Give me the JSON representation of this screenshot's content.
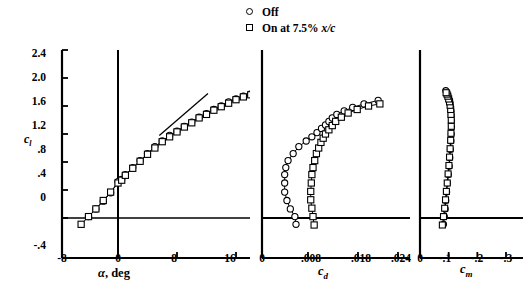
{
  "figure": {
    "width": 523,
    "height": 295,
    "background": "#ffffff",
    "line_color": "#000000"
  },
  "legend": {
    "position": "top-center",
    "items": [
      {
        "marker": "circle",
        "label": "Off"
      },
      {
        "marker": "square",
        "label": "On at 7.5% x/c"
      }
    ]
  },
  "chart_data": [
    {
      "type": "scatter",
      "panel": "lift-curve",
      "title": "",
      "xlabel": "α, deg",
      "ylabel": "c_l",
      "xlim": [
        -8,
        24
      ],
      "ylim": [
        -0.4,
        2.4
      ],
      "xticks": [
        -8,
        0,
        8,
        16,
        24
      ],
      "xticklabels": [
        "-8",
        "0",
        "8",
        "16",
        "24"
      ],
      "yticks": [
        -0.4,
        0,
        0.4,
        0.8,
        1.2,
        1.6,
        2.0,
        2.4
      ],
      "yticklabels": [
        "-.4",
        "0",
        ".4",
        ".8",
        "1.2",
        "1.6",
        "2.0",
        "2.4"
      ],
      "grid": false,
      "zero_lines": [
        "x=0",
        "y=0"
      ],
      "reference_line": {
        "x": [
          5.6,
          12.2
        ],
        "y": [
          1.18,
          1.78
        ]
      },
      "series": [
        {
          "name": "Off",
          "marker": "circle",
          "x": [
            -4.0,
            -3.0,
            -2.0,
            -1.0,
            0.0,
            0.5,
            1.0,
            2.0,
            3.0,
            4.0,
            5.0,
            6.0,
            7.0,
            8.0,
            9.0,
            10.0,
            11.0,
            12.0,
            13.0,
            14.0,
            15.0,
            16.0,
            17.0,
            18.0,
            19.0,
            20.0
          ],
          "y": [
            0.02,
            0.13,
            0.24,
            0.36,
            0.52,
            0.55,
            0.62,
            0.72,
            0.82,
            0.92,
            1.02,
            1.1,
            1.18,
            1.24,
            1.31,
            1.37,
            1.44,
            1.49,
            1.55,
            1.6,
            1.66,
            1.7,
            1.74,
            1.77,
            1.79,
            1.82
          ]
        },
        {
          "name": "On at 7.5% x/c",
          "marker": "square",
          "x": [
            -5.0,
            -4.0,
            -3.0,
            -2.0,
            -1.0,
            0.0,
            0.5,
            1.0,
            2.0,
            3.0,
            4.0,
            5.0,
            6.0,
            7.0,
            8.0,
            9.0,
            10.0,
            11.0,
            12.0,
            13.0,
            14.0,
            15.0,
            16.0,
            17.0,
            18.0,
            19.0,
            20.0
          ],
          "y": [
            -0.09,
            0.02,
            0.13,
            0.25,
            0.37,
            0.5,
            0.54,
            0.61,
            0.71,
            0.81,
            0.91,
            1.0,
            1.09,
            1.16,
            1.23,
            1.3,
            1.36,
            1.43,
            1.48,
            1.54,
            1.59,
            1.64,
            1.69,
            1.73,
            1.76,
            1.78,
            1.79
          ]
        }
      ]
    },
    {
      "type": "scatter",
      "panel": "drag-polar",
      "title": "",
      "xlabel": "c_d",
      "ylabel": "",
      "xlim": [
        0,
        0.024
      ],
      "ylim": [
        -0.4,
        2.4
      ],
      "xticks": [
        0,
        0.008,
        0.018,
        0.024
      ],
      "xticklabels": [
        "0",
        ".008",
        ".018",
        ".024"
      ],
      "grid": false,
      "zero_lines": [
        "y=0"
      ],
      "series": [
        {
          "name": "Off",
          "marker": "circle",
          "x": [
            0.006,
            0.0058,
            0.005,
            0.0044,
            0.004,
            0.004,
            0.004,
            0.0042,
            0.0046,
            0.0055,
            0.0065,
            0.0078,
            0.0088,
            0.0097,
            0.0105,
            0.0112,
            0.0118,
            0.0124,
            0.0132,
            0.0145,
            0.016,
            0.018,
            0.0205
          ],
          "y": [
            -0.09,
            0.02,
            0.13,
            0.25,
            0.37,
            0.5,
            0.62,
            0.72,
            0.82,
            0.92,
            1.02,
            1.1,
            1.16,
            1.22,
            1.28,
            1.33,
            1.38,
            1.43,
            1.48,
            1.53,
            1.58,
            1.63,
            1.68
          ]
        },
        {
          "name": "On at 7.5% x/c",
          "marker": "square",
          "x": [
            0.0092,
            0.009,
            0.0088,
            0.0086,
            0.0086,
            0.0087,
            0.0088,
            0.009,
            0.0093,
            0.0096,
            0.01,
            0.0104,
            0.0108,
            0.0112,
            0.0118,
            0.0124,
            0.013,
            0.014,
            0.0152,
            0.0168,
            0.0188,
            0.0208
          ],
          "y": [
            -0.1,
            0.02,
            0.14,
            0.26,
            0.38,
            0.5,
            0.62,
            0.72,
            0.82,
            0.92,
            1.0,
            1.08,
            1.14,
            1.2,
            1.26,
            1.32,
            1.38,
            1.44,
            1.5,
            1.55,
            1.6,
            1.63
          ]
        }
      ]
    },
    {
      "type": "scatter",
      "panel": "moment-curve",
      "title": "",
      "xlabel": "c_m",
      "ylabel": "",
      "xlim": [
        0,
        -0.3
      ],
      "ylim": [
        -0.4,
        2.4
      ],
      "xticks": [
        0,
        -0.1,
        -0.2,
        -0.3
      ],
      "xticklabels": [
        "0",
        "-.1",
        "-.2",
        "-.3"
      ],
      "grid": false,
      "zero_lines": [
        "y=0"
      ],
      "series": [
        {
          "name": "Off",
          "marker": "circle",
          "x": [
            -0.082,
            -0.085,
            -0.088,
            -0.09,
            -0.093,
            -0.096,
            -0.099,
            -0.102,
            -0.104,
            -0.106,
            -0.108,
            -0.109,
            -0.11,
            -0.11,
            -0.109,
            -0.108,
            -0.106,
            -0.104,
            -0.101,
            -0.098,
            -0.095,
            -0.092,
            -0.09
          ],
          "y": [
            -0.09,
            0.02,
            0.13,
            0.25,
            0.37,
            0.5,
            0.62,
            0.74,
            0.86,
            0.98,
            1.1,
            1.2,
            1.3,
            1.39,
            1.47,
            1.54,
            1.6,
            1.66,
            1.7,
            1.74,
            1.77,
            1.8,
            1.82
          ]
        },
        {
          "name": "On at 7.5% x/c",
          "marker": "square",
          "x": [
            -0.078,
            -0.082,
            -0.086,
            -0.089,
            -0.092,
            -0.095,
            -0.098,
            -0.101,
            -0.103,
            -0.105,
            -0.107,
            -0.108,
            -0.109,
            -0.109,
            -0.108,
            -0.107,
            -0.105,
            -0.103,
            -0.1,
            -0.097,
            -0.094,
            -0.091
          ],
          "y": [
            -0.1,
            0.02,
            0.14,
            0.26,
            0.38,
            0.5,
            0.63,
            0.75,
            0.87,
            0.99,
            1.11,
            1.21,
            1.31,
            1.4,
            1.48,
            1.55,
            1.61,
            1.66,
            1.7,
            1.74,
            1.77,
            1.79
          ]
        }
      ]
    }
  ]
}
